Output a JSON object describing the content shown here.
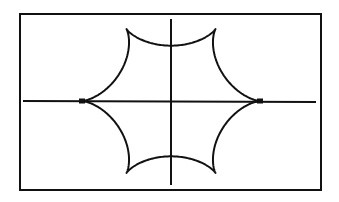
{
  "chart_data": {
    "type": "line",
    "title": "",
    "xlabel": "",
    "ylabel": "",
    "curve": {
      "kind": "hypocycloid",
      "cusps": 6,
      "radius": 1
    },
    "xlim": [
      -1.65,
      1.65
    ],
    "ylim": [
      -1.0,
      1.0
    ],
    "grid": false,
    "axes_visible": true,
    "colors": {
      "curve": "#111111",
      "axes": "#111111",
      "frame": "#111111",
      "background": "#ffffff"
    }
  }
}
